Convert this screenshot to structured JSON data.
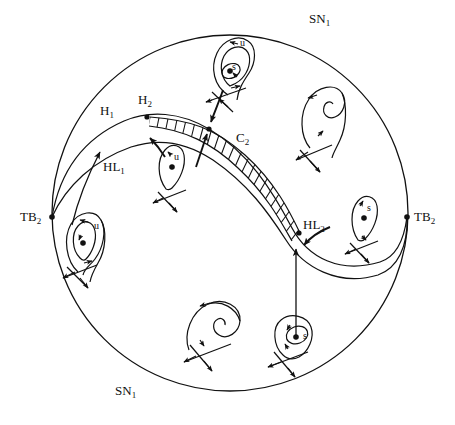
{
  "figure": {
    "type": "phase-portrait-bifurcation-diagram",
    "background_color": "#ffffff",
    "stroke_color": "#111111",
    "boundary": {
      "shape": "circle",
      "center_x": 230,
      "center_y": 213,
      "radius": 178
    }
  },
  "labels": {
    "sn1_top": {
      "text": "SN",
      "sub": "1",
      "x": 309,
      "y": 12
    },
    "sn1_bottom": {
      "text": "SN",
      "sub": "1",
      "x": 115,
      "y": 384
    },
    "h1": {
      "text": "H",
      "sub": "1",
      "x": 100,
      "y": 104
    },
    "h2": {
      "text": "H",
      "sub": "2",
      "x": 138,
      "y": 93
    },
    "hl1": {
      "text": "HL",
      "sub": "1",
      "x": 103,
      "y": 160
    },
    "hl2": {
      "text": "HL",
      "sub": "2",
      "x": 303,
      "y": 218
    },
    "c2": {
      "text": "C",
      "sub": "2",
      "x": 236,
      "y": 131
    },
    "tb2_left": {
      "text": "TB",
      "sub": "2",
      "x": 20,
      "y": 210
    },
    "tb2_right": {
      "text": "TB",
      "sub": "2",
      "x": 414,
      "y": 210
    }
  },
  "cycle_markers": [
    {
      "name": "unstable-cycle-top-portrait",
      "text": "u",
      "x": 240,
      "y": 38
    },
    {
      "name": "stable-cycle-top-portrait",
      "text": "s",
      "x": 232,
      "y": 62
    },
    {
      "name": "unstable-cycle-mid-left-portrait",
      "text": "u",
      "x": 174,
      "y": 152
    },
    {
      "name": "unstable-cycle-left-portrait",
      "text": "u",
      "x": 94,
      "y": 221
    },
    {
      "name": "stable-cycle-right-portrait",
      "text": "s",
      "x": 367,
      "y": 203
    },
    {
      "name": "stable-cycle-bottom-right-portrait",
      "text": "s",
      "x": 303,
      "y": 331
    }
  ],
  "bifurcation_points": [
    {
      "name": "point-h2",
      "x": 147,
      "y": 117
    },
    {
      "name": "point-c2",
      "x": 209,
      "y": 129
    },
    {
      "name": "point-hl2",
      "x": 299,
      "y": 233
    },
    {
      "name": "point-tb2-left",
      "x": 52,
      "y": 217
    },
    {
      "name": "point-tb2-right",
      "x": 407,
      "y": 217
    }
  ],
  "curves": {
    "h_curve_label": "Hopf bifurcation curve H1-H2",
    "hl_curve_label": "homoclinic loop curve HL1-HL2",
    "c2_band_label": "C2 saddle-node of limit cycles band (hatched)"
  },
  "portraits": [
    {
      "name": "portrait-top-center",
      "description": "double limit cycle around focus, u outer s inner"
    },
    {
      "name": "portrait-top-right",
      "description": "saddle spiral homoclinic"
    },
    {
      "name": "portrait-mid-left",
      "description": "unstable homoclinic loop u"
    },
    {
      "name": "portrait-left",
      "description": "unstable limit cycle u around focus"
    },
    {
      "name": "portrait-right",
      "description": "stable limit cycle s loop"
    },
    {
      "name": "portrait-bottom-left",
      "description": "saddle spiral no cycle"
    },
    {
      "name": "portrait-bottom-right",
      "description": "stable limit cycle s around focus"
    }
  ]
}
